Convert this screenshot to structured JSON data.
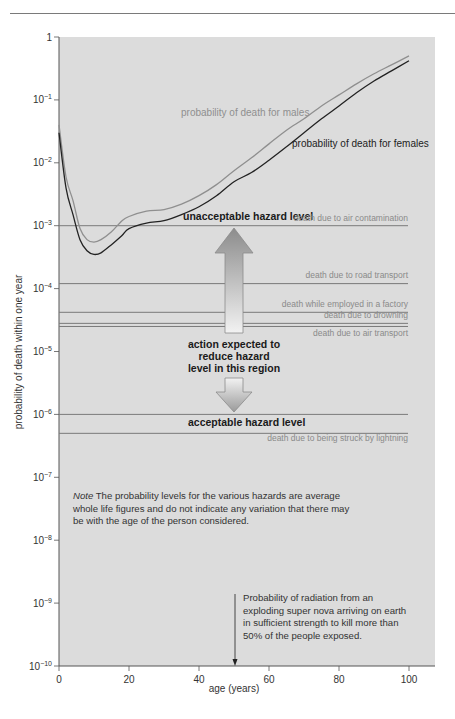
{
  "chart_data": {
    "type": "line",
    "title": "",
    "xlabel": "age (years)",
    "ylabel": "probability of death within one year",
    "yscale": "log",
    "xlim": [
      0,
      100
    ],
    "ylim": [
      1e-10,
      1
    ],
    "grid": false,
    "x_ticks": [
      "0",
      "20",
      "40",
      "60",
      "80",
      "100"
    ],
    "y_ticks": [
      {
        "base": "1",
        "exp": ""
      },
      {
        "base": "10",
        "exp": "−1"
      },
      {
        "base": "10",
        "exp": "−2"
      },
      {
        "base": "10",
        "exp": "−3"
      },
      {
        "base": "10",
        "exp": "−4"
      },
      {
        "base": "10",
        "exp": "−5"
      },
      {
        "base": "10",
        "exp": "−6"
      },
      {
        "base": "10",
        "exp": "−7"
      },
      {
        "base": "10",
        "exp": "−8"
      },
      {
        "base": "10",
        "exp": "−9"
      },
      {
        "base": "10",
        "exp": "−10"
      }
    ],
    "series": [
      {
        "name": "probability of death for males",
        "color": "#8f8f8f",
        "x": [
          0,
          2,
          4,
          6,
          8,
          10,
          12,
          15,
          18,
          20,
          25,
          30,
          35,
          40,
          45,
          50,
          55,
          60,
          65,
          70,
          75,
          80,
          85,
          90,
          95,
          100
        ],
        "values": [
          0.04,
          0.006,
          0.0025,
          0.0009,
          0.0006,
          0.00055,
          0.0006,
          0.0008,
          0.0012,
          0.0014,
          0.0017,
          0.0018,
          0.0022,
          0.003,
          0.0045,
          0.0075,
          0.012,
          0.02,
          0.033,
          0.05,
          0.08,
          0.12,
          0.18,
          0.26,
          0.36,
          0.5
        ]
      },
      {
        "name": "probability of death for females",
        "color": "#222222",
        "x": [
          0,
          2,
          4,
          6,
          8,
          10,
          12,
          15,
          18,
          20,
          25,
          30,
          35,
          40,
          45,
          50,
          55,
          60,
          65,
          70,
          75,
          80,
          85,
          90,
          95,
          100
        ],
        "values": [
          0.03,
          0.004,
          0.0015,
          0.0006,
          0.0004,
          0.00035,
          0.00037,
          0.0005,
          0.0007,
          0.0009,
          0.0011,
          0.0012,
          0.0015,
          0.002,
          0.003,
          0.005,
          0.007,
          0.011,
          0.018,
          0.03,
          0.05,
          0.08,
          0.13,
          0.2,
          0.29,
          0.42
        ]
      }
    ],
    "hazard_levels": [
      {
        "label": "death due to air contamination",
        "value": 0.001
      },
      {
        "label": "death due to road transport",
        "value": 0.00012
      },
      {
        "label": "death while employed in a factory",
        "value": 4.2e-05
      },
      {
        "label": "death due to drowning",
        "value": 2.8e-05
      },
      {
        "label": "death due to air transport",
        "value": 2.5e-05
      },
      {
        "label": "death due to being struck by lightning",
        "value": 5e-07
      }
    ],
    "thresholds": [
      {
        "label": "unacceptable hazard level",
        "value": 0.001
      },
      {
        "label": "acceptable hazard level",
        "value": 1e-06
      }
    ],
    "annotations": [
      {
        "text": "action expected to reduce hazard level in this region",
        "lines": [
          "action expected to",
          "reduce hazard",
          "level in this region"
        ]
      },
      {
        "text": "Probability of radiation from an exploding super nova arriving on earth in sufficient strength to kill more than 50% of the people exposed.",
        "x": 50,
        "arrow_to": 1e-10
      }
    ]
  },
  "labels": {
    "males": "probability of death for males",
    "females": "probability of death for females",
    "unacceptable": "unacceptable hazard level",
    "acceptable": "acceptable hazard level",
    "action_line1": "action expected to",
    "action_line2": "reduce hazard",
    "action_line3": "level in this region",
    "air_contamination": "death due to air contamination",
    "road_transport": "death due to road transport",
    "factory": "death while employed in a factory",
    "drowning": "death due to drowning",
    "air_transport": "death due to air transport",
    "lightning": "death due to being struck by lightning"
  },
  "note": {
    "prefix": "Note",
    "text": " The probability levels for the various hazards are average whole life figures and do not indicate any variation that there may be with the age of the person considered."
  },
  "nova_note": "Probability of radiation from an exploding super nova arriving on earth in sufficient strength to kill more than 50% of the people exposed.",
  "colors": {
    "plot_bg": "#dcdcdc",
    "axis": "#555555",
    "hazard_line": "#7a7a7a",
    "male": "#8f8f8f",
    "female": "#222222"
  }
}
